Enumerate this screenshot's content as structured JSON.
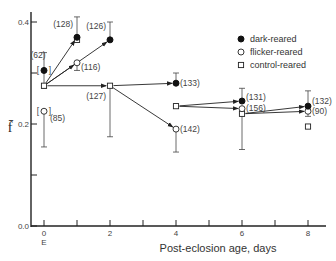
{
  "chart_data": {
    "type": "line",
    "title": "",
    "xlabel": "Post-eclosion age, days",
    "ylabel": "f̄",
    "x_ticks": [
      "0",
      "2",
      "4",
      "6",
      "8"
    ],
    "x_tick_sublabel": "E",
    "y_ticks": [
      "0.0",
      "0.2",
      "0.4"
    ],
    "xlim": [
      0,
      8.5
    ],
    "ylim": [
      0,
      0.42
    ],
    "grid": false,
    "legend_position": "upper right",
    "legend": [
      {
        "name": "dark-reared",
        "marker": "filled-circle"
      },
      {
        "name": "flicker-reared",
        "marker": "open-circle"
      },
      {
        "name": "control-reared",
        "marker": "open-square"
      }
    ],
    "series": [
      {
        "name": "dark-reared",
        "points": [
          {
            "x": 0,
            "y": 0.305,
            "n": "62",
            "bracketed": true,
            "err": 0.035
          },
          {
            "x": 1,
            "y": 0.37,
            "n": "128",
            "err": 0.04
          },
          {
            "x": 2,
            "y": 0.365,
            "n": "126",
            "err": 0.035
          },
          {
            "x": 4,
            "y": 0.28,
            "n": "133",
            "err": 0.02
          },
          {
            "x": 6,
            "y": 0.245,
            "n": "131",
            "err": 0.025
          },
          {
            "x": 8,
            "y": 0.235,
            "n": "132",
            "err": 0.03
          }
        ]
      },
      {
        "name": "flicker-reared",
        "points": [
          {
            "x": 0,
            "y": 0.225,
            "n": "85",
            "bracketed": true,
            "err": 0.07
          },
          {
            "x": 1,
            "y": 0.32,
            "n": "116",
            "err": 0.015
          },
          {
            "x": 4,
            "y": 0.19,
            "n": "142",
            "err": 0.045
          },
          {
            "x": 6,
            "y": 0.23,
            "n": "156",
            "err": 0.01
          },
          {
            "x": 8,
            "y": 0.225,
            "n": "90",
            "err": 0.01
          }
        ]
      },
      {
        "name": "control-reared",
        "points": [
          {
            "x": 0,
            "y": 0.275
          },
          {
            "x": 1,
            "y": 0.365
          },
          {
            "x": 2,
            "y": 0.275,
            "n": "127",
            "err": 0.1
          },
          {
            "x": 4,
            "y": 0.235
          },
          {
            "x": 6,
            "y": 0.22,
            "err": 0.07
          },
          {
            "x": 8,
            "y": 0.195
          }
        ]
      }
    ],
    "arrows": [
      {
        "from": [
          0,
          0.275
        ],
        "to": [
          1,
          0.37
        ]
      },
      {
        "from": [
          0,
          0.275
        ],
        "to": [
          1,
          0.32
        ]
      },
      {
        "from": [
          0,
          0.275
        ],
        "to": [
          2,
          0.365
        ]
      },
      {
        "from": [
          0,
          0.275
        ],
        "to": [
          2,
          0.275
        ]
      },
      {
        "from": [
          2,
          0.275
        ],
        "to": [
          4,
          0.28
        ]
      },
      {
        "from": [
          2,
          0.275
        ],
        "to": [
          4,
          0.19
        ]
      },
      {
        "from": [
          4,
          0.235
        ],
        "to": [
          6,
          0.245
        ]
      },
      {
        "from": [
          4,
          0.235
        ],
        "to": [
          6,
          0.23
        ]
      },
      {
        "from": [
          6,
          0.22
        ],
        "to": [
          8,
          0.235
        ]
      },
      {
        "from": [
          6,
          0.22
        ],
        "to": [
          8,
          0.225
        ]
      }
    ]
  }
}
